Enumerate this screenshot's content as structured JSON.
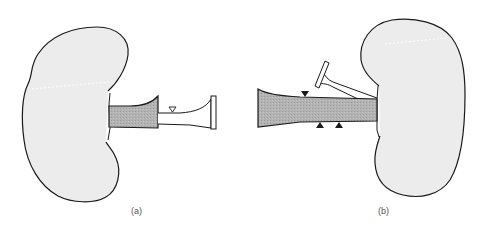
{
  "figure": {
    "panels": [
      {
        "id": "a",
        "label": "(a)",
        "description": "Kidney with shaded renal pelvis and narrow ureter; open triangle marker on ureter",
        "markers": [
          {
            "type": "open-triangle-down",
            "x": 172,
            "y": 108
          }
        ]
      },
      {
        "id": "b",
        "label": "(b)",
        "description": "Mirrored kidney with wide shaded ureter and a second branching tube; filled triangle markers",
        "markers": [
          {
            "type": "filled-triangle-down",
            "x": 305,
            "y": 94
          },
          {
            "type": "filled-triangle-up",
            "x": 320,
            "y": 125
          },
          {
            "type": "filled-triangle-up",
            "x": 340,
            "y": 125
          }
        ]
      }
    ]
  },
  "colors": {
    "background": "#ffffff",
    "kidney_fill": "#ececec",
    "shaded_fill": "#b0b0b0",
    "stroke": "#1a1a1a",
    "dotted_line": "#ffffff",
    "label_text": "#555555"
  }
}
